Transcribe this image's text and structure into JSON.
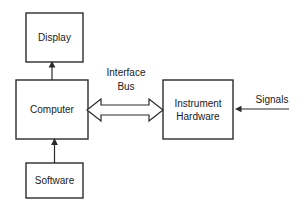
{
  "diagram": {
    "background_color": "#ffffff",
    "stroke_color": "#2b2b2b",
    "text_color": "#1a1a1a",
    "nodes": [
      {
        "id": "display",
        "label": "Display",
        "x": 26,
        "y": 13,
        "w": 57,
        "h": 49
      },
      {
        "id": "computer",
        "label": "Computer",
        "x": 16,
        "y": 80,
        "w": 72,
        "h": 59
      },
      {
        "id": "software",
        "label": "Software",
        "x": 26,
        "y": 163,
        "w": 57,
        "h": 35
      },
      {
        "id": "instrument_hardware",
        "label_line1": "Instrument",
        "label_line2": "Hardware",
        "x": 163,
        "y": 80,
        "w": 70,
        "h": 59
      }
    ],
    "edges": [
      {
        "id": "computer-to-display",
        "label": "",
        "type": "line-arrow",
        "direction": "up"
      },
      {
        "id": "software-to-computer",
        "label": "",
        "type": "line-arrow",
        "direction": "up"
      },
      {
        "id": "computer-to-instrument",
        "label_line1": "Interface",
        "label_line2": "Bus",
        "type": "block-arrow",
        "direction": "bidirectional"
      },
      {
        "id": "signals-to-instrument",
        "label": "Signals",
        "type": "line-arrow",
        "direction": "left"
      }
    ]
  }
}
